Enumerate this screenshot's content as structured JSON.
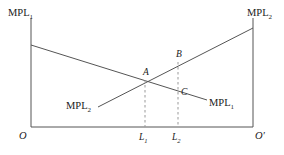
{
  "figure": {
    "background": "#ffffff",
    "line_color": "#555555",
    "dash_color": "#999999",
    "text_color": "#1a1a1a"
  },
  "axis": {
    "left_origin_label": "O",
    "right_origin_label": "O′",
    "baseline_y": 127,
    "left_x": 31,
    "right_x": 253,
    "top_y": 18
  },
  "curves": [
    {
      "name": "mpl1",
      "axis_label": "MPL",
      "axis_sub": "1",
      "end_label": "MPL",
      "end_sub": "1",
      "direction": "downward-sloping",
      "from": [
        31,
        45
      ],
      "to": [
        207,
        100
      ]
    },
    {
      "name": "mpl2",
      "axis_label": "MPL",
      "axis_sub": "2",
      "end_label": "MPL",
      "end_sub": "2",
      "direction": "upward-sloping",
      "from": [
        98,
        107
      ],
      "to": [
        253,
        28
      ]
    }
  ],
  "points": [
    {
      "id": "A",
      "label": "A",
      "x": 145,
      "y": 80
    },
    {
      "id": "B",
      "label": "B",
      "x": 178,
      "y": 62
    },
    {
      "id": "C",
      "label": "C",
      "x": 178,
      "y": 92
    }
  ],
  "ticks": [
    {
      "label": "L",
      "sub": "1",
      "x": 145
    },
    {
      "label": "L",
      "sub": "2",
      "x": 178
    }
  ],
  "dashed_lines": [
    {
      "name": "l1-dashed",
      "x": 145,
      "y_top": 80,
      "y_bottom": 127
    },
    {
      "name": "l2-dashed",
      "x": 178,
      "y_top": 62,
      "y_bottom": 127
    }
  ]
}
